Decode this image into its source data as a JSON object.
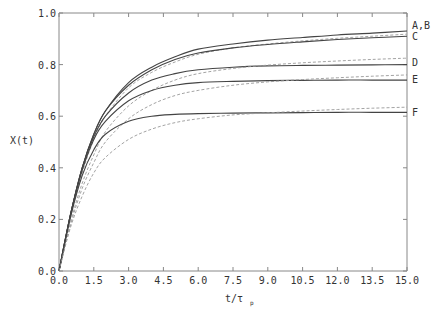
{
  "chart_data": {
    "type": "line",
    "title": "",
    "xlabel": "t/τp",
    "ylabel": "X(t)",
    "xlim": [
      0,
      15
    ],
    "ylim": [
      0,
      1.0
    ],
    "x_ticks": [
      "0.0",
      "1.5",
      "3.0",
      "4.5",
      "6.0",
      "7.5",
      "9.0",
      "10.5",
      "12.0",
      "13.5",
      "15.0"
    ],
    "y_ticks": [
      "0.0",
      "0.2",
      "0.4",
      "0.6",
      "0.8",
      "1.0"
    ],
    "grid": false,
    "legend": "curve labels at right end",
    "x": [
      0,
      0.5,
      1.0,
      1.5,
      2.0,
      3.0,
      4.0,
      5.0,
      6.0,
      7.5,
      9.0,
      10.5,
      12.0,
      13.5,
      15.0
    ],
    "series": [
      {
        "name": "A (solid)",
        "label": "A,B",
        "style": "solid",
        "values": [
          0,
          0.22,
          0.4,
          0.53,
          0.62,
          0.73,
          0.79,
          0.83,
          0.86,
          0.88,
          0.895,
          0.905,
          0.915,
          0.922,
          0.93
        ]
      },
      {
        "name": "B (dashed)",
        "label": "",
        "style": "dashed",
        "values": [
          0,
          0.21,
          0.38,
          0.51,
          0.6,
          0.71,
          0.77,
          0.81,
          0.84,
          0.865,
          0.88,
          0.892,
          0.902,
          0.91,
          0.918
        ]
      },
      {
        "name": "C (solid)",
        "label": "C",
        "style": "solid",
        "values": [
          0,
          0.22,
          0.4,
          0.53,
          0.62,
          0.72,
          0.78,
          0.82,
          0.845,
          0.865,
          0.878,
          0.888,
          0.897,
          0.904,
          0.91
        ]
      },
      {
        "name": "D (solid)",
        "label": "D",
        "style": "solid",
        "values": [
          0,
          0.22,
          0.4,
          0.52,
          0.6,
          0.69,
          0.74,
          0.765,
          0.78,
          0.79,
          0.795,
          0.797,
          0.798,
          0.799,
          0.8
        ]
      },
      {
        "name": "D (dashed)",
        "label": "",
        "style": "dashed",
        "values": [
          0,
          0.19,
          0.34,
          0.45,
          0.54,
          0.64,
          0.7,
          0.74,
          0.765,
          0.785,
          0.798,
          0.807,
          0.814,
          0.82,
          0.825
        ]
      },
      {
        "name": "E (solid)",
        "label": "E",
        "style": "solid",
        "values": [
          0,
          0.22,
          0.39,
          0.51,
          0.58,
          0.66,
          0.7,
          0.72,
          0.73,
          0.735,
          0.738,
          0.739,
          0.74,
          0.74,
          0.74
        ]
      },
      {
        "name": "E (dashed)",
        "label": "",
        "style": "dashed",
        "values": [
          0,
          0.18,
          0.32,
          0.42,
          0.5,
          0.59,
          0.645,
          0.68,
          0.7,
          0.72,
          0.733,
          0.742,
          0.749,
          0.755,
          0.76
        ]
      },
      {
        "name": "F (solid)",
        "label": "F",
        "style": "solid",
        "values": [
          0,
          0.21,
          0.37,
          0.47,
          0.53,
          0.58,
          0.6,
          0.607,
          0.61,
          0.612,
          0.613,
          0.614,
          0.615,
          0.615,
          0.615
        ]
      },
      {
        "name": "F (dashed)",
        "label": "",
        "style": "dashed",
        "values": [
          0,
          0.17,
          0.29,
          0.38,
          0.44,
          0.51,
          0.55,
          0.575,
          0.59,
          0.605,
          0.613,
          0.62,
          0.626,
          0.631,
          0.635
        ]
      }
    ],
    "colors": {
      "axis": "#888888",
      "solid": "#444444",
      "dashed": "#999999",
      "text": "#333333"
    }
  },
  "labels": {
    "ylabel": "X(t)",
    "xlabel_main": "t/τ",
    "xlabel_sub": "p",
    "AB": "A,B",
    "C": "C",
    "D": "D",
    "E": "E",
    "F": "F"
  }
}
